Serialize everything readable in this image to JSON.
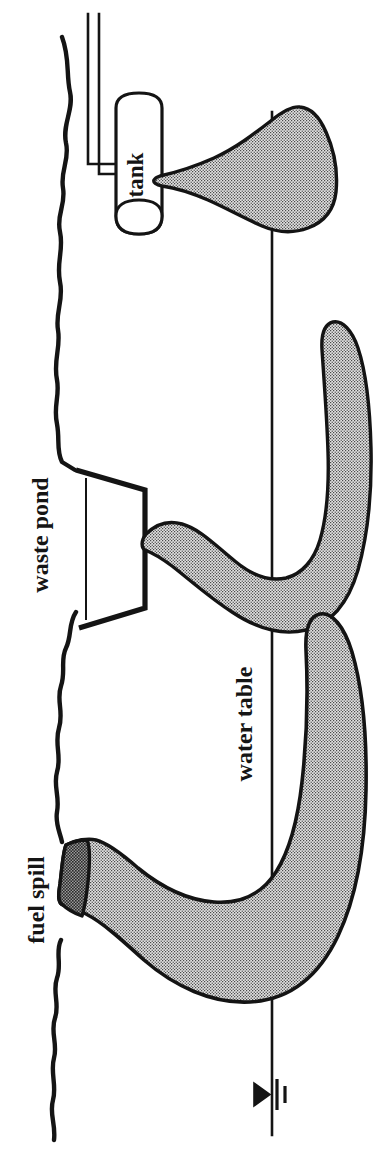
{
  "figure": {
    "kind": "hydrogeologic-cross-section",
    "orientation_note": "diagram rendered rotated 90 degrees counter-clockwise",
    "background_color": "#ffffff",
    "ink_color": "#141414",
    "plume_fill_color": "#d9d9d9",
    "plume_stipple_color": "#4a4a4a",
    "spill_dark_band_color": "#3a3a3a"
  },
  "labels": {
    "tank": "tank",
    "waste_pond": "waste pond",
    "water_table": "water table",
    "fuel_spill": "fuel spill"
  },
  "elements": {
    "ground_surface": "ground-surface-line",
    "water_table_line": "water-table-line",
    "water_table_symbol": "water-table-triangle-symbol",
    "tank_body": "underground-storage-tank",
    "tank_fill_pipe": "tank-fill-pipe",
    "waste_pond_basin": "waste-pond-basin",
    "plumes": [
      {
        "name": "tank-leak-plume",
        "source": "tank"
      },
      {
        "name": "waste-pond-plume",
        "source": "waste pond"
      },
      {
        "name": "fuel-spill-plume",
        "source": "fuel spill"
      }
    ]
  }
}
